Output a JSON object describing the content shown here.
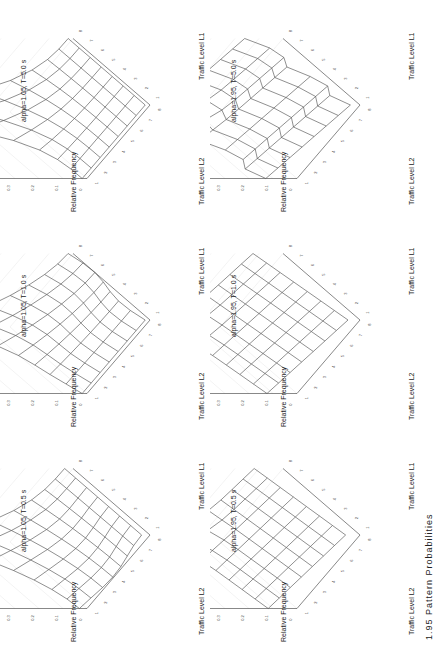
{
  "figure": {
    "caption_partial": "1.95 Pattern Probabilities",
    "orientation": "rotated 90° counter-clockwise",
    "axis_labels": {
      "z": "Relative Frequency",
      "x": "Traffic Level L1",
      "y": "Traffic Level L2"
    },
    "z_ticks": [
      "0",
      "0.1",
      "0.2",
      "0.3",
      "0.4",
      "0.5"
    ],
    "l_ticks": [
      "1",
      "2",
      "3",
      "4",
      "5",
      "6",
      "7",
      "8"
    ]
  },
  "panels": [
    {
      "title": "alpha=1.05, T=5.0 s"
    },
    {
      "title": "alpha=1.05, T=1.0 s"
    },
    {
      "title": "alpha=1.05, T=0.5 s"
    },
    {
      "title": "alpha=1.95, T=5.0 s"
    },
    {
      "title": "alpha=1.95, T=1.0 s"
    },
    {
      "title": "alpha=1.95, T=0.5 s"
    }
  ],
  "chart_data": [
    {
      "type": "surface",
      "title": "alpha=1.05, T=5.0 s",
      "xlabel": "Traffic Level L1",
      "ylabel": "Traffic Level L2",
      "zlabel": "Relative Frequency",
      "x": [
        1,
        2,
        3,
        4,
        5,
        6,
        7,
        8
      ],
      "y": [
        1,
        2,
        3,
        4,
        5,
        6,
        7,
        8
      ],
      "zlim": [
        0,
        0.5
      ],
      "peak": {
        "L1": 8,
        "L2": 8,
        "z": 0.5
      }
    },
    {
      "type": "surface",
      "title": "alpha=1.05, T=1.0 s",
      "xlabel": "Traffic Level L1",
      "ylabel": "Traffic Level L2",
      "zlabel": "Relative Frequency",
      "x": [
        1,
        2,
        3,
        4,
        5,
        6,
        7,
        8
      ],
      "y": [
        1,
        2,
        3,
        4,
        5,
        6,
        7,
        8
      ],
      "zlim": [
        0,
        0.5
      ],
      "peak": {
        "L1": 8,
        "L2": 8,
        "z": 0.3
      }
    },
    {
      "type": "surface",
      "title": "alpha=1.05, T=0.5 s",
      "xlabel": "Traffic Level L1",
      "ylabel": "Traffic Level L2",
      "zlabel": "Relative Frequency",
      "x": [
        1,
        2,
        3,
        4,
        5,
        6,
        7,
        8
      ],
      "y": [
        1,
        2,
        3,
        4,
        5,
        6,
        7,
        8
      ],
      "zlim": [
        0,
        0.5
      ],
      "peak": {
        "L1": 8,
        "L2": 8,
        "z": 0.3
      }
    },
    {
      "type": "surface",
      "title": "alpha=1.95, T=5.0 s",
      "xlabel": "Traffic Level L1",
      "ylabel": "Traffic Level L2",
      "zlabel": "Relative Frequency",
      "x": [
        1,
        2,
        3,
        4,
        5,
        6,
        7,
        8
      ],
      "y": [
        1,
        2,
        3,
        4,
        5,
        6,
        7,
        8
      ],
      "zlim": [
        0,
        0.5
      ],
      "peak": {
        "L1": 8,
        "L2": 8,
        "z": 0.3
      }
    },
    {
      "type": "surface",
      "title": "alpha=1.95, T=1.0 s",
      "xlabel": "Traffic Level L1",
      "ylabel": "Traffic Level L2",
      "zlabel": "Relative Frequency",
      "x": [
        1,
        2,
        3,
        4,
        5,
        6,
        7,
        8
      ],
      "y": [
        1,
        2,
        3,
        4,
        5,
        6,
        7,
        8
      ],
      "zlim": [
        0,
        0.5
      ],
      "peak": {
        "L1": 8,
        "L2": 8,
        "z": 0.25
      }
    },
    {
      "type": "surface",
      "title": "alpha=1.95, T=0.5 s",
      "xlabel": "Traffic Level L1",
      "ylabel": "Traffic Level L2",
      "zlabel": "Relative Frequency",
      "x": [
        1,
        2,
        3,
        4,
        5,
        6,
        7,
        8
      ],
      "y": [
        1,
        2,
        3,
        4,
        5,
        6,
        7,
        8
      ],
      "zlim": [
        0,
        0.5
      ],
      "peak": {
        "L1": 8,
        "L2": 8,
        "z": 0.22
      }
    }
  ]
}
